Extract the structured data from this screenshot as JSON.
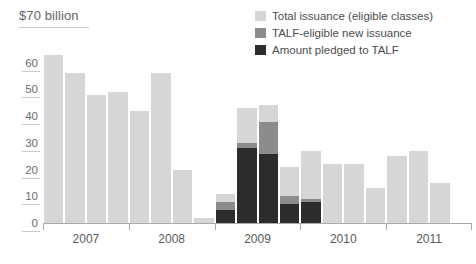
{
  "header": {
    "unit_label": "$70 billion"
  },
  "legend": {
    "position": "top-right",
    "items": [
      {
        "label": "Total issuance (eligible classes)",
        "color": "#d6d6d6",
        "name": "total-issuance"
      },
      {
        "label": "TALF-eligible new issuance",
        "color": "#8b8c8e",
        "name": "talf-eligible-new-issuance"
      },
      {
        "label": "Amount pledged to TALF",
        "color": "#2c2c2c",
        "name": "amount-pledged-to-talf"
      }
    ]
  },
  "chart_data": {
    "type": "bar",
    "stacked": true,
    "title": "",
    "subtitle": "",
    "xlabel": "",
    "ylabel": "$70 billion",
    "ylim": [
      0,
      70
    ],
    "ytick_values": [
      0,
      10,
      20,
      30,
      40,
      50,
      60
    ],
    "ytick_labels": [
      "0",
      "10",
      "20",
      "30",
      "40",
      "50",
      "60"
    ],
    "grid": false,
    "x_group_labels": [
      "2007",
      "2008",
      "2009",
      "2010",
      "2011"
    ],
    "categories": [
      "2007 Q1",
      "2007 Q2",
      "2007 Q3",
      "2007 Q4",
      "2008 Q1",
      "2008 Q2",
      "2008 Q3",
      "2008 Q4",
      "2009 Q1",
      "2009 Q2",
      "2009 Q3",
      "2009 Q4",
      "2010 Q1",
      "2010 Q2",
      "2010 Q3",
      "2010 Q4",
      "2011 Q1",
      "2011 Q2",
      "2011 Q3",
      "2011 Q4"
    ],
    "series": [
      {
        "name": "Total issuance (eligible classes)",
        "color": "#d6d6d6",
        "values": [
          63,
          56,
          48,
          49,
          42,
          56,
          20,
          2,
          11,
          43,
          44,
          21,
          27,
          22,
          22,
          13,
          25,
          27,
          15,
          0
        ]
      },
      {
        "name": "TALF-eligible new issuance",
        "color": "#8b8c8e",
        "values": [
          0,
          0,
          0,
          0,
          0,
          0,
          0,
          0,
          8,
          30,
          38,
          10,
          9,
          0,
          0,
          0,
          0,
          0,
          0,
          0
        ]
      },
      {
        "name": "Amount pledged to TALF",
        "color": "#2c2c2c",
        "values": [
          0,
          0,
          0,
          0,
          0,
          0,
          0,
          0,
          5,
          28,
          26,
          7,
          8,
          0,
          0,
          0,
          0,
          0,
          0,
          0
        ]
      }
    ]
  }
}
